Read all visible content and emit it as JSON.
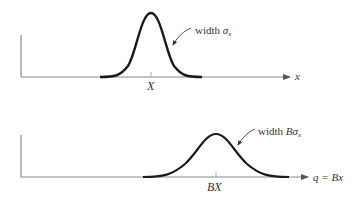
{
  "panels": [
    {
      "id": "top",
      "curve_label_prefix": "width ",
      "curve_label_symbol": "σ",
      "curve_label_subscript": "x",
      "center_tick_label": "X",
      "axis_label": "x"
    },
    {
      "id": "bottom",
      "curve_label_prefix": "width ",
      "curve_label_symbol": "Bσ",
      "curve_label_subscript": "x",
      "center_tick_label": "BX",
      "axis_label": "q = Bx"
    }
  ],
  "colors": {
    "curve": "#1a1a1a",
    "axis": "#777777",
    "text": "#333333"
  }
}
